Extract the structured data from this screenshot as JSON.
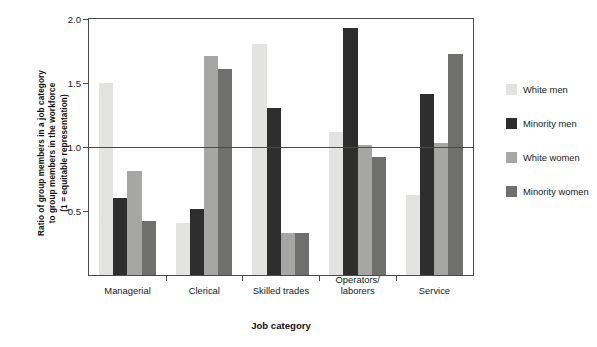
{
  "chart_data": {
    "type": "bar",
    "title": "",
    "xlabel": "Job category",
    "ylabel": "Ratio of group members in a job category\nto group members in the workforce\n(1 = equitable representation)",
    "ylim": [
      0,
      2.0
    ],
    "yticks": [
      0.5,
      1.0,
      1.5,
      2.0
    ],
    "ytick_labels": [
      "0.5",
      "1.0",
      "1.5",
      "2.0"
    ],
    "grid": false,
    "legend_position": "right",
    "reference_line": 1.0,
    "categories": [
      "Managerial",
      "Clerical",
      "Skilled trades",
      "Operators/\nlaborers",
      "Service"
    ],
    "series": [
      {
        "name": "White men",
        "color": "#e3e3e1",
        "values": [
          1.5,
          0.41,
          1.81,
          1.12,
          0.63
        ]
      },
      {
        "name": "Minority men",
        "color": "#2e2e2e",
        "values": [
          0.6,
          0.52,
          1.31,
          1.93,
          1.42
        ]
      },
      {
        "name": "White women",
        "color": "#a6a6a4",
        "values": [
          0.81,
          1.71,
          0.33,
          1.02,
          1.03
        ]
      },
      {
        "name": "Minority women",
        "color": "#6f6f6e",
        "values": [
          0.42,
          1.61,
          0.33,
          0.92,
          1.73
        ]
      }
    ]
  },
  "axes": {
    "y_title": "Ratio of group members in a job category\nto group members in the workforce\n(1 = equitable representation)",
    "x_title": "Job category"
  },
  "legend": {
    "items": [
      {
        "label": "White men",
        "color": "#e3e3e1"
      },
      {
        "label": "Minority men",
        "color": "#2e2e2e"
      },
      {
        "label": "White women",
        "color": "#a6a6a4"
      },
      {
        "label": "Minority women",
        "color": "#6f6f6e"
      }
    ]
  }
}
